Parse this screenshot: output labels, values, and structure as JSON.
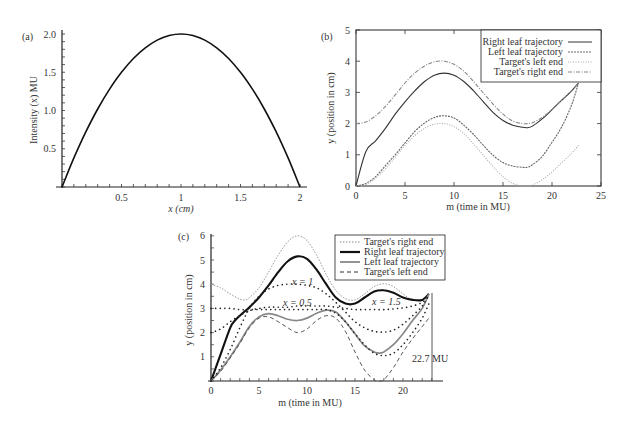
{
  "chart_data": [
    {
      "panel": "(a)",
      "type": "line",
      "title": "",
      "xlabel": "x (cm)",
      "ylabel": "Intensity (x) MU",
      "xlim": [
        0,
        2
      ],
      "ylim": [
        0,
        2
      ],
      "xticks": [
        "0.5",
        "1",
        "1.5",
        "2"
      ],
      "yticks": [
        "0.5",
        "1.0",
        "1.5",
        "2.0"
      ],
      "grid": false,
      "series": [
        {
          "name": "Intensity",
          "x": [
            0,
            0.1,
            0.2,
            0.3,
            0.4,
            0.5,
            0.6,
            0.7,
            0.8,
            0.9,
            1.0,
            1.1,
            1.2,
            1.3,
            1.4,
            1.5,
            1.6,
            1.7,
            1.8,
            1.9,
            2.0
          ],
          "y": [
            0,
            0.38,
            0.72,
            1.02,
            1.28,
            1.5,
            1.68,
            1.82,
            1.92,
            1.98,
            2.0,
            1.98,
            1.92,
            1.82,
            1.68,
            1.5,
            1.28,
            1.02,
            0.72,
            0.38,
            0
          ]
        }
      ]
    },
    {
      "panel": "(b)",
      "type": "line",
      "title": "",
      "xlabel": "m (time in MU)",
      "ylabel": "y (position in cm)",
      "xlim": [
        0,
        25
      ],
      "ylim": [
        0,
        5
      ],
      "xticks": [
        "0",
        "5",
        "10",
        "15",
        "20",
        "25"
      ],
      "yticks": [
        "0",
        "1",
        "2",
        "3",
        "4",
        "5"
      ],
      "grid": false,
      "legend_position": "upper right",
      "series": [
        {
          "name": "Right leaf trajectory",
          "style": "solid",
          "x": [
            0,
            1,
            2,
            3,
            4,
            5,
            6,
            7,
            8,
            9,
            10,
            11,
            12,
            13,
            14,
            15,
            16,
            17,
            17.5,
            18,
            19,
            20,
            21,
            22,
            22.7
          ],
          "y": [
            0,
            1.1,
            1.45,
            1.85,
            2.3,
            2.7,
            3.05,
            3.35,
            3.55,
            3.62,
            3.55,
            3.35,
            3.05,
            2.7,
            2.35,
            2.1,
            1.95,
            1.88,
            1.87,
            1.92,
            2.15,
            2.45,
            2.75,
            3.05,
            3.3
          ]
        },
        {
          "name": "Left leaf trajectory",
          "style": "dashed",
          "x": [
            0,
            1,
            2,
            3,
            4,
            5,
            6,
            7,
            8,
            9,
            10,
            11,
            12,
            13,
            14,
            15,
            16,
            17,
            17.5,
            18,
            19,
            20,
            21,
            22,
            22.7
          ],
          "y": [
            0,
            0.08,
            0.3,
            0.65,
            1.0,
            1.38,
            1.75,
            2.02,
            2.2,
            2.25,
            2.18,
            1.95,
            1.65,
            1.3,
            0.98,
            0.75,
            0.64,
            0.6,
            0.6,
            0.68,
            0.95,
            1.4,
            1.9,
            2.6,
            3.3
          ]
        },
        {
          "name": "Target's left end",
          "style": "dotted",
          "x": [
            0,
            1,
            2,
            3,
            4,
            5,
            6,
            7,
            8,
            9,
            10,
            11,
            12,
            13,
            14,
            15,
            16,
            17,
            17.5,
            18,
            19,
            20,
            21,
            22,
            22.7
          ],
          "y": [
            0,
            0.05,
            0.25,
            0.55,
            0.92,
            1.3,
            1.62,
            1.85,
            1.98,
            2.0,
            1.9,
            1.68,
            1.35,
            0.98,
            0.62,
            0.3,
            0.08,
            0.0,
            0.0,
            0.03,
            0.2,
            0.45,
            0.75,
            1.05,
            1.3
          ]
        },
        {
          "name": "Target's right end",
          "style": "dash-dot",
          "x": [
            0,
            1,
            2,
            3,
            4,
            5,
            6,
            7,
            8,
            9,
            10,
            11,
            12,
            13,
            14,
            15,
            16,
            17,
            17.5,
            18,
            19,
            20,
            21,
            22,
            22.7
          ],
          "y": [
            2.0,
            2.05,
            2.25,
            2.55,
            2.92,
            3.3,
            3.62,
            3.85,
            3.98,
            4.0,
            3.9,
            3.68,
            3.35,
            2.98,
            2.62,
            2.3,
            2.08,
            2.0,
            2.0,
            2.03,
            2.2,
            2.45,
            2.75,
            3.05,
            3.3
          ]
        }
      ]
    },
    {
      "panel": "(c)",
      "type": "line",
      "title": "",
      "xlabel": "m (time in MU)",
      "ylabel": "y (position in cm)",
      "xlim": [
        0,
        23
      ],
      "ylim": [
        0,
        6
      ],
      "xticks": [
        "0",
        "5",
        "10",
        "15",
        "20"
      ],
      "yticks": [
        "1",
        "2",
        "3",
        "4",
        "5",
        "6"
      ],
      "grid": false,
      "legend_position": "upper right",
      "annotations": [
        "x = 1",
        "x = 0.5",
        "x = 1.5",
        "22.7 MU"
      ],
      "series": [
        {
          "name": "Target's right end",
          "style": "dotted-light",
          "x": [
            0,
            1,
            2,
            3,
            3.5,
            4,
            5,
            6,
            7,
            8,
            9,
            10,
            11,
            12,
            13,
            14,
            15,
            16,
            17,
            18,
            19,
            20,
            21,
            22,
            22.7
          ],
          "y": [
            4.0,
            3.85,
            3.6,
            3.38,
            3.35,
            3.45,
            3.85,
            4.5,
            5.2,
            5.75,
            6.0,
            5.8,
            5.2,
            4.4,
            3.75,
            3.4,
            3.35,
            3.6,
            3.9,
            4.02,
            3.9,
            3.6,
            3.35,
            3.35,
            3.55
          ]
        },
        {
          "name": "Right leaf trajectory",
          "style": "solid-thick",
          "x": [
            0,
            1,
            2,
            2.5,
            3,
            4,
            5,
            6,
            7,
            8,
            9,
            10,
            11,
            12,
            13,
            14,
            15,
            16,
            17,
            18,
            19,
            20,
            21,
            22,
            22.7
          ],
          "y": [
            0,
            1.1,
            2.2,
            2.5,
            2.7,
            3.05,
            3.45,
            3.95,
            4.5,
            4.95,
            5.15,
            5.05,
            4.6,
            4.0,
            3.45,
            3.2,
            3.2,
            3.45,
            3.7,
            3.75,
            3.65,
            3.45,
            3.35,
            3.35,
            3.6
          ]
        },
        {
          "name": "Left leaf trajectory",
          "style": "solid-gray",
          "x": [
            0,
            1,
            2,
            3,
            4,
            5,
            6,
            7,
            8,
            9,
            10,
            11,
            12,
            13,
            14,
            15,
            16,
            17,
            17.5,
            18,
            19,
            20,
            21,
            22,
            22.7
          ],
          "y": [
            0,
            0.45,
            1.0,
            1.6,
            2.25,
            2.65,
            2.78,
            2.7,
            2.55,
            2.5,
            2.6,
            2.8,
            2.93,
            2.85,
            2.45,
            1.95,
            1.45,
            1.2,
            1.15,
            1.2,
            1.5,
            1.95,
            2.5,
            3.0,
            3.6
          ]
        },
        {
          "name": "Target's left end",
          "style": "dashed",
          "x": [
            0,
            1,
            2,
            3,
            4,
            5,
            6,
            7,
            8,
            9,
            10,
            11,
            12,
            13,
            14,
            15,
            16,
            17,
            17.5,
            18,
            19,
            20,
            21,
            22,
            22.7
          ],
          "y": [
            0,
            0.4,
            0.95,
            1.55,
            2.2,
            2.6,
            2.65,
            2.45,
            2.2,
            2.0,
            2.15,
            2.5,
            2.7,
            2.6,
            2.05,
            1.2,
            0.45,
            0.05,
            0.0,
            0.05,
            0.55,
            1.2,
            1.75,
            2.25,
            2.6
          ]
        },
        {
          "name": "x = 1",
          "style": "dotted-black",
          "x": [
            0,
            1,
            2,
            3,
            4,
            5,
            6,
            7,
            8,
            9,
            10,
            11,
            12,
            13,
            14,
            15,
            16,
            17,
            18,
            19,
            20,
            21,
            22,
            22.7
          ],
          "y": [
            0,
            0.55,
            1.3,
            2.2,
            3.0,
            3.5,
            3.8,
            3.95,
            4.0,
            4.0,
            3.95,
            3.85,
            3.6,
            3.25,
            2.85,
            2.45,
            2.2,
            2.05,
            2.02,
            2.1,
            2.35,
            2.7,
            3.1,
            3.55
          ]
        },
        {
          "name": "x = 0.5",
          "style": "dotted-black",
          "x": [
            0,
            1,
            2,
            3,
            4,
            5,
            6,
            7,
            8,
            9,
            10,
            11,
            12,
            13,
            14,
            15,
            16,
            17,
            18,
            19,
            20,
            21,
            22,
            22.7
          ],
          "y": [
            2.0,
            2.15,
            2.45,
            2.7,
            2.9,
            3.0,
            3.05,
            3.05,
            3.05,
            3.1,
            3.1,
            3.1,
            3.1,
            3.05,
            3.0,
            2.95,
            2.95,
            2.95,
            2.95,
            2.98,
            3.02,
            3.1,
            3.25,
            3.5
          ]
        },
        {
          "name": "x = 1.5",
          "style": "dotted-black",
          "x": [
            0,
            1,
            2,
            3,
            4,
            5,
            6,
            7,
            8,
            9,
            10,
            11,
            12,
            13,
            14,
            15,
            16,
            17,
            18,
            19,
            20,
            21,
            22,
            22.7
          ],
          "y": [
            3.0,
            3.0,
            3.0,
            2.95,
            2.95,
            2.95,
            2.95,
            2.95,
            2.95,
            2.95,
            2.95,
            2.95,
            2.95,
            2.8,
            2.45,
            1.95,
            1.5,
            1.15,
            1.05,
            1.15,
            1.5,
            2.0,
            2.6,
            3.2
          ]
        }
      ]
    }
  ],
  "panels": {
    "a": {
      "label": "(a)",
      "xlabel": "x (cm)",
      "ylabel": "Intensity (x) MU",
      "xticks": [
        {
          "v": 0.5,
          "t": "0.5"
        },
        {
          "v": 1,
          "t": "1"
        },
        {
          "v": 1.5,
          "t": "1.5"
        },
        {
          "v": 2,
          "t": "2"
        }
      ],
      "yticks": [
        {
          "v": 0.5,
          "t": "0.5"
        },
        {
          "v": 1.0,
          "t": "1.0"
        },
        {
          "v": 1.5,
          "t": "1.5"
        },
        {
          "v": 2.0,
          "t": "2.0"
        }
      ]
    },
    "b": {
      "label": "(b)",
      "xlabel": "m (time in MU)",
      "ylabel": "y (position in cm)",
      "legend": [
        "Right leaf trajectory",
        "Left leaf trajectory",
        "Target's left end",
        "Target's right end"
      ]
    },
    "c": {
      "label": "(c)",
      "xlabel": "m (time in MU)",
      "ylabel": "y (position in cm)",
      "legend": [
        "Target's right end",
        "Right leaf trajectory",
        "Left leaf trajectory",
        "Target's left end"
      ],
      "annotations": {
        "x1": "x = 1",
        "x05": "x = 0.5",
        "x15": "x = 1.5",
        "end": "22.7 MU"
      }
    }
  }
}
